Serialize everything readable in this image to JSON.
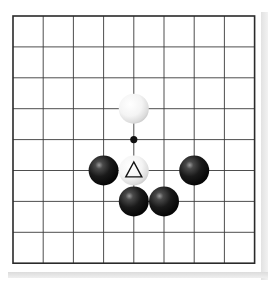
{
  "diagram": {
    "type": "go-board-diagram",
    "grid": {
      "columns": 9,
      "rows": 9,
      "origin_x": 13,
      "origin_y": 16,
      "spacing_x": 30.2,
      "spacing_y": 30.9,
      "line_color": "#3a3a3a",
      "border_color": "#2a2a2a",
      "board_color": "#ffffff"
    },
    "star_points": [
      {
        "col": 5,
        "row": 5
      }
    ],
    "stones": [
      {
        "color": "white",
        "col": 5,
        "row": 4,
        "marker": null
      },
      {
        "color": "black",
        "col": 4,
        "row": 6,
        "marker": null
      },
      {
        "color": "white",
        "col": 5,
        "row": 6,
        "marker": "triangle"
      },
      {
        "color": "black",
        "col": 7,
        "row": 6,
        "marker": null
      },
      {
        "color": "black",
        "col": 5,
        "row": 7,
        "marker": null
      },
      {
        "color": "black",
        "col": 6,
        "row": 7,
        "marker": null
      }
    ],
    "stone_radius": 15,
    "colors": {
      "black_stone": "#141414",
      "black_highlight": "#8a8a8a",
      "white_stone": "#ffffff",
      "white_shade": "#c8c8c8",
      "marker": "#111111"
    }
  }
}
